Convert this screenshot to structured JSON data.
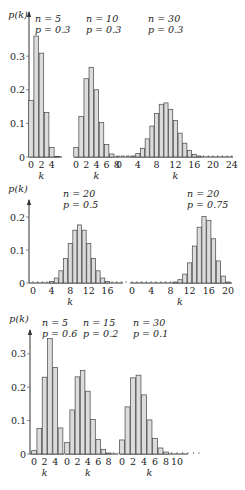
{
  "chart_data": [
    {
      "type": "bar",
      "title": "Binomial distributions (row 1)",
      "ylabel": "p(k)",
      "xlabel": "k",
      "yticks": [
        "0",
        "0.1",
        "0.2",
        "0.3"
      ],
      "ylim": [
        0,
        0.36
      ],
      "panels": [
        {
          "label_n": "n = 5",
          "label_p": "p = 0.3",
          "n": 5,
          "p": 0.3,
          "xticks": [
            "0",
            "2",
            "4"
          ],
          "values": [
            0.168,
            0.36,
            0.309,
            0.132,
            0.028,
            0.002
          ]
        },
        {
          "label_n": "n = 10",
          "label_p": "p = 0.3",
          "n": 10,
          "p": 0.3,
          "xticks": [
            "0",
            "2",
            "4",
            "6",
            "8"
          ],
          "values": [
            0.028,
            0.121,
            0.233,
            0.267,
            0.2,
            0.103,
            0.037,
            0.009,
            0.001,
            0.0,
            0.0
          ]
        },
        {
          "label_n": "n = 30",
          "label_p": "p = 0.3",
          "n": 30,
          "p": 0.3,
          "xticks": [
            "0",
            "4",
            "8",
            "12",
            "16",
            "20",
            "24"
          ],
          "values": [
            0.0,
            0.0,
            0.001,
            0.003,
            0.01,
            0.026,
            0.054,
            0.092,
            0.13,
            0.157,
            0.161,
            0.142,
            0.109,
            0.071,
            0.041,
            0.02,
            0.008,
            0.003,
            0.001,
            0.0,
            0.0,
            0.0,
            0.0,
            0.0,
            0.0
          ]
        }
      ]
    },
    {
      "type": "bar",
      "title": "Binomial distributions (row 2)",
      "ylabel": "p(k)",
      "xlabel": "k",
      "yticks": [
        "0",
        "0.1",
        "0.2"
      ],
      "ylim": [
        0,
        0.22
      ],
      "panels": [
        {
          "label_n": "n = 20",
          "label_p": "p = 0.5",
          "n": 20,
          "p": 0.5,
          "xticks": [
            "0",
            "4",
            "8",
            "12",
            "16"
          ],
          "values": [
            0.0,
            0.0,
            0.0,
            0.001,
            0.005,
            0.015,
            0.037,
            0.074,
            0.12,
            0.16,
            0.176,
            0.16,
            0.12,
            0.074,
            0.037,
            0.015,
            0.005,
            0.001,
            0.0,
            0.0,
            0.0
          ]
        },
        {
          "label_n": "n = 20",
          "label_p": "p = 0.75",
          "n": 20,
          "p": 0.75,
          "xticks": [
            "0",
            "4",
            "8",
            "12",
            "16",
            "20"
          ],
          "values": [
            0.0,
            0.0,
            0.0,
            0.0,
            0.0,
            0.0,
            0.0,
            0.0,
            0.001,
            0.003,
            0.01,
            0.027,
            0.061,
            0.112,
            0.169,
            0.202,
            0.19,
            0.134,
            0.067,
            0.021,
            0.003
          ]
        }
      ]
    },
    {
      "type": "bar",
      "title": "Binomial distributions (row 3)",
      "ylabel": "p(k)",
      "xlabel": "k",
      "yticks": [
        "0",
        "0.1",
        "0.2",
        "0.3"
      ],
      "ylim": [
        0,
        0.36
      ],
      "panels": [
        {
          "label_n": "n = 5",
          "label_p": "p = 0.6",
          "n": 5,
          "p": 0.6,
          "xticks": [
            "0",
            "2",
            "4"
          ],
          "values": [
            0.01,
            0.077,
            0.23,
            0.346,
            0.259,
            0.078
          ]
        },
        {
          "label_n": "n = 15",
          "label_p": "p = 0.2",
          "n": 15,
          "p": 0.2,
          "xticks": [
            "0",
            "2",
            "4",
            "6",
            "8"
          ],
          "values": [
            0.035,
            0.132,
            0.231,
            0.25,
            0.188,
            0.103,
            0.043,
            0.014,
            0.003,
            0.001,
            0.0
          ]
        },
        {
          "label_n": "n = 30",
          "label_p": "p = 0.1",
          "n": 30,
          "p": 0.1,
          "xticks": [
            "0",
            "2",
            "4",
            "6",
            "8",
            "10"
          ],
          "values": [
            0.042,
            0.141,
            0.228,
            0.236,
            0.177,
            0.102,
            0.047,
            0.018,
            0.006,
            0.001,
            0.0,
            0.0,
            0.0,
            0.0,
            0.0
          ]
        }
      ]
    }
  ]
}
